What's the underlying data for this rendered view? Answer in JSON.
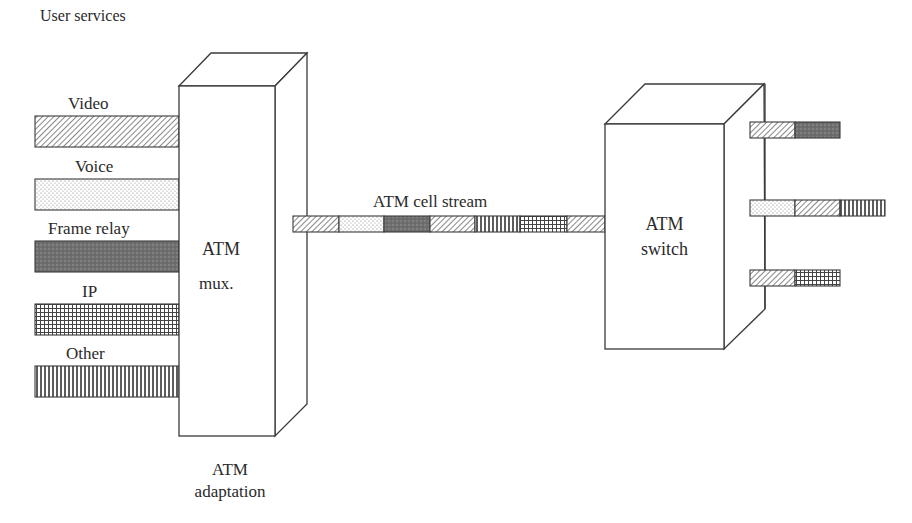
{
  "title": "User services",
  "colors": {
    "stroke": "#3a3a3a",
    "dark_fill": "#6f6f6f",
    "background": "#ffffff"
  },
  "inputs": [
    {
      "label": "Video",
      "pattern": "diagonal-hatch"
    },
    {
      "label": "Voice",
      "pattern": "dots"
    },
    {
      "label": "Frame relay",
      "pattern": "dark-stipple"
    },
    {
      "label": "IP",
      "pattern": "grid"
    },
    {
      "label": "Other",
      "pattern": "vertical-lines"
    }
  ],
  "mux": {
    "line1": "ATM",
    "line2": "mux.",
    "caption1": "ATM",
    "caption2": "adaptation"
  },
  "stream": {
    "label": "ATM cell stream",
    "cells": [
      "diagonal-hatch",
      "dots",
      "dark-stipple",
      "diagonal-hatch",
      "vertical-lines",
      "grid",
      "diagonal-hatch"
    ]
  },
  "switch": {
    "line1": "ATM",
    "line2": "switch"
  },
  "outputs": [
    {
      "cells": [
        "diagonal-hatch",
        "dark-stipple"
      ]
    },
    {
      "cells": [
        "dots",
        "diagonal-hatch",
        "vertical-lines"
      ]
    },
    {
      "cells": [
        "diagonal-hatch",
        "grid"
      ]
    }
  ]
}
